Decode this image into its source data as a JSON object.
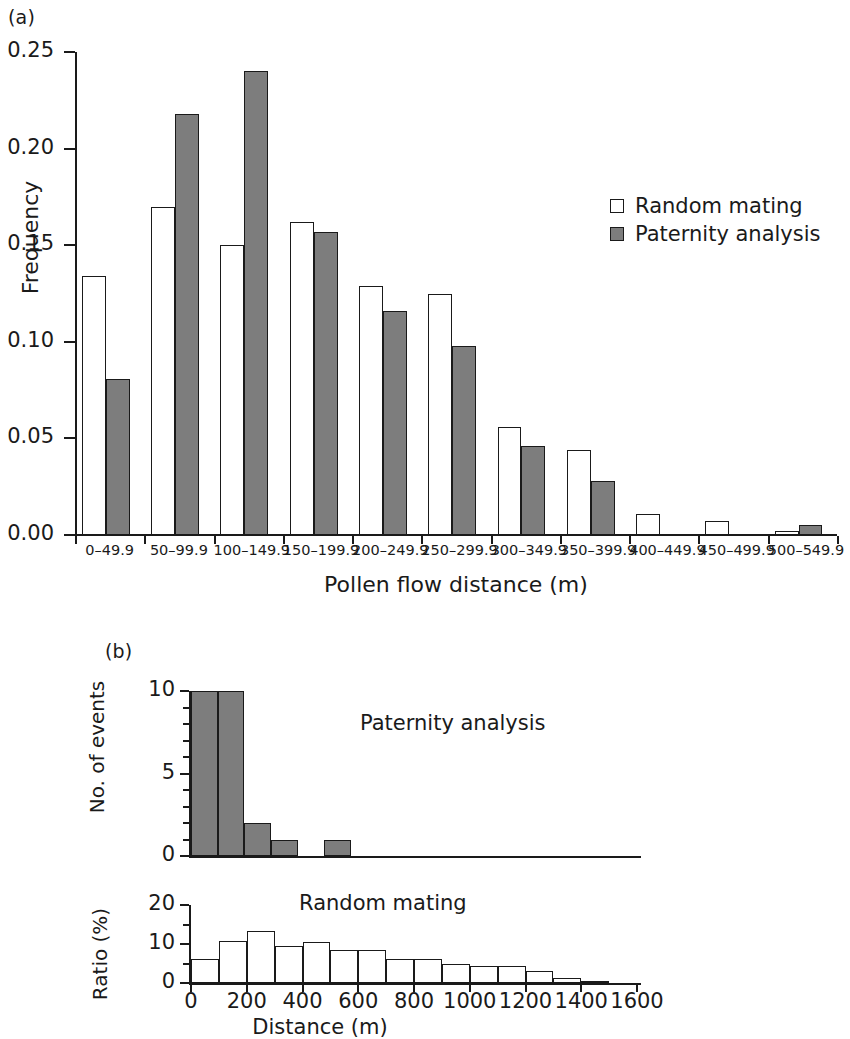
{
  "figure": {
    "panel_a_label": "(a)",
    "panel_b_label": "(b)"
  },
  "chart_data": [
    {
      "id": "panel_a",
      "type": "bar",
      "title": "",
      "xlabel": "Pollen flow distance (m)",
      "ylabel": "Frequency",
      "ylim": [
        0,
        0.25
      ],
      "ytick_labels": [
        "0.00",
        "0.05",
        "0.10",
        "0.15",
        "0.20",
        "0.25"
      ],
      "ytick_values": [
        0,
        0.05,
        0.1,
        0.15,
        0.2,
        0.25
      ],
      "grid": false,
      "legend_position": "upper-right-inside",
      "categories": [
        "0–49.9",
        "50–99.9",
        "100–149.9",
        "150–199.9",
        "200–249.9",
        "250–299.9",
        "300–349.9",
        "350–399.9",
        "400–449.9",
        "450–499.9",
        "500–549.9"
      ],
      "series": [
        {
          "name": "Random mating",
          "color": "#ffffff",
          "values": [
            0.134,
            0.17,
            0.15,
            0.162,
            0.129,
            0.125,
            0.056,
            0.044,
            0.011,
            0.007,
            0.002
          ]
        },
        {
          "name": "Paternity analysis",
          "color": "#7d7d7d",
          "values": [
            0.081,
            0.218,
            0.24,
            0.157,
            0.116,
            0.098,
            0.046,
            0.028,
            0.0,
            0.0,
            0.005
          ]
        }
      ]
    },
    {
      "id": "panel_b_top",
      "type": "bar",
      "title": "Paternity analysis",
      "xlabel": "",
      "ylabel": "No. of events",
      "ylim": [
        0,
        10
      ],
      "ytick_labels": [
        "0",
        "5",
        "10"
      ],
      "ytick_values": [
        0,
        5,
        10
      ],
      "grid": false,
      "bin_width": 100,
      "x": [
        0,
        100,
        200,
        300,
        400,
        500
      ],
      "values": [
        10,
        10,
        2,
        1,
        0,
        1
      ]
    },
    {
      "id": "panel_b_bottom",
      "type": "bar",
      "title": "Random mating",
      "xlabel": "Distance (m)",
      "ylabel": "Ratio (%)",
      "ylim": [
        0,
        20
      ],
      "ytick_labels": [
        "0",
        "10",
        "20"
      ],
      "ytick_values": [
        0,
        10,
        20
      ],
      "xtick_labels": [
        "0",
        "200",
        "400",
        "600",
        "800",
        "1000",
        "1200",
        "1400",
        "1600"
      ],
      "xtick_values": [
        0,
        200,
        400,
        600,
        800,
        1000,
        1200,
        1400,
        1600
      ],
      "xlim": [
        0,
        1600
      ],
      "grid": false,
      "bin_width": 100,
      "x": [
        0,
        100,
        200,
        300,
        400,
        500,
        600,
        700,
        800,
        900,
        1000,
        1100,
        1200,
        1300,
        1400,
        1500
      ],
      "values": [
        6.2,
        10.8,
        13.3,
        9.6,
        10.4,
        8.5,
        8.5,
        6.1,
        6.1,
        4.8,
        4.3,
        4.3,
        3.0,
        1.4,
        0.3,
        0.0
      ]
    }
  ]
}
